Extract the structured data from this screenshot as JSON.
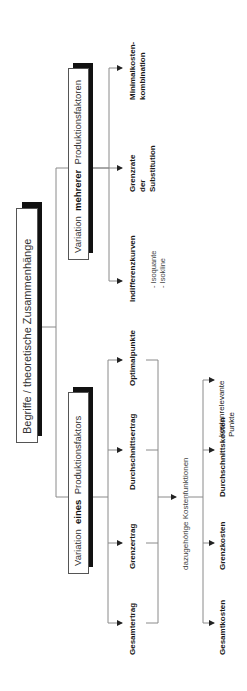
{
  "root": {
    "label": "Begriffe / theoretische Zusammenhänge"
  },
  "branch_multi": {
    "label_pre": "Variation",
    "label_bold": "mehrerer",
    "label_post": "Produktionsfaktoren",
    "children": [
      {
        "line1": "Indifferenzkurven",
        "subitems": [
          "- Isoquante",
          "- Isokline"
        ]
      },
      {
        "line1": "Grenzrate",
        "line2": "der",
        "line3": "Substitution"
      },
      {
        "line1": "Minimalkosten-",
        "line2": "kombination"
      }
    ]
  },
  "branch_single": {
    "label_pre": "Variation",
    "label_bold": "eines",
    "label_post": "Produktionsfaktors",
    "children": [
      {
        "line1": "Gesamtertrag"
      },
      {
        "line1": "Grenzertrag"
      },
      {
        "line1": "Durchschnittsertrag"
      },
      {
        "line1": "Optimalpunkte"
      }
    ],
    "connector_label": "dazugehörige Kostenfunktionen",
    "cost_children": [
      {
        "line1": "Gesamtkosten"
      },
      {
        "line1": "Grenzkosten"
      },
      {
        "line1": "Durchschnittskosten"
      },
      {
        "line1": "kostenrelevante",
        "line2": "Punkte"
      }
    ]
  },
  "colors": {
    "line": "#888888",
    "shadow": "#111111",
    "text": "#1a1a1a"
  }
}
